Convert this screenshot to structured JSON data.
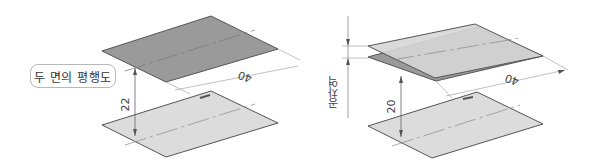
{
  "left_figure": {
    "callout_label": "두 면의 평행도",
    "height_dimension": "22",
    "length_dimension": "40"
  },
  "right_figure": {
    "tolerance_label": "공차역",
    "height_dimension": "20",
    "length_dimension": "40"
  },
  "colors": {
    "dark_plate": "#9a9a9a",
    "light_plate": "#dcdcdc",
    "tolerance_plate_top": "#d6d6d6",
    "outline": "#555555",
    "dimension_line": "#b0b0b0"
  }
}
